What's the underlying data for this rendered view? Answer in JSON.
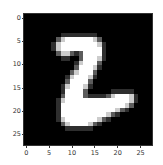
{
  "chart_data": {
    "type": "heatmap",
    "title": "",
    "xlabel": "",
    "ylabel": "",
    "colormap": "gray",
    "shape": [
      28,
      28
    ],
    "xlim": [
      -0.5,
      27.5
    ],
    "ylim": [
      27.5,
      -0.5
    ],
    "xticks": [
      0,
      5,
      10,
      15,
      20,
      25
    ],
    "yticks": [
      0,
      5,
      10,
      15,
      20,
      25
    ],
    "bright_rows": {
      "5": [
        [
          8,
          15
        ]
      ],
      "6": [
        [
          7,
          16
        ]
      ],
      "7": [
        [
          7,
          16
        ]
      ],
      "8": [
        [
          8,
          9
        ],
        [
          13,
          16
        ]
      ],
      "9": [
        [
          13,
          16
        ]
      ],
      "10": [
        [
          12,
          15
        ]
      ],
      "11": [
        [
          12,
          15
        ]
      ],
      "12": [
        [
          11,
          14
        ]
      ],
      "13": [
        [
          10,
          14
        ]
      ],
      "14": [
        [
          10,
          13
        ]
      ],
      "15": [
        [
          9,
          13
        ]
      ],
      "16": [
        [
          9,
          12
        ]
      ],
      "17": [
        [
          9,
          12
        ],
        [
          19,
          23
        ]
      ],
      "18": [
        [
          8,
          23
        ]
      ],
      "19": [
        [
          8,
          22
        ]
      ],
      "20": [
        [
          8,
          20
        ]
      ],
      "21": [
        [
          8,
          18
        ]
      ],
      "22": [
        [
          8,
          16
        ]
      ],
      "23": [
        [
          9,
          14
        ]
      ]
    }
  },
  "axes": {
    "yticks": [
      "0",
      "5",
      "10",
      "15",
      "20",
      "25"
    ],
    "xticks": [
      "0",
      "5",
      "10",
      "15",
      "20",
      "25"
    ]
  }
}
